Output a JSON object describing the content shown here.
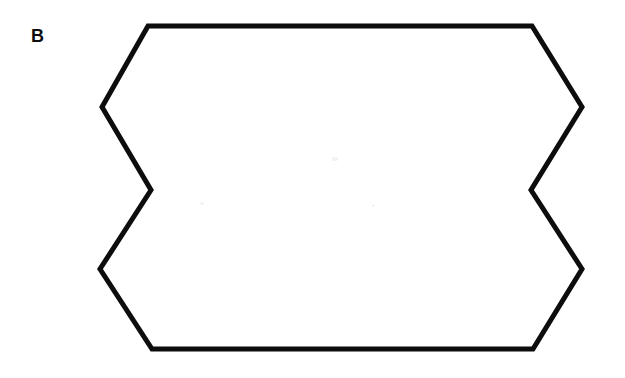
{
  "figure": {
    "panel_label": "B",
    "background_color": "#ffffff",
    "stroke_color": "#0d0d0d",
    "stroke_width": 5,
    "canvas_width": 625,
    "canvas_height": 378
  },
  "chart_data": {
    "type": "diagram",
    "title": "B",
    "shape_name": "concave-decagon-outline",
    "fill": "none",
    "stroke": "#0d0d0d",
    "stroke_width": 5,
    "closed": true,
    "xlim": [
      0,
      625
    ],
    "ylim": [
      0,
      378
    ],
    "grid": false,
    "legend": false,
    "vertices": [
      {
        "name": "top-left",
        "x": 148,
        "y": 26
      },
      {
        "name": "top-right",
        "x": 532,
        "y": 26
      },
      {
        "name": "right-upper-bulge",
        "x": 582,
        "y": 107
      },
      {
        "name": "right-inner-notch",
        "x": 531,
        "y": 190
      },
      {
        "name": "right-lower-bulge",
        "x": 582,
        "y": 269
      },
      {
        "name": "bottom-right",
        "x": 533,
        "y": 349
      },
      {
        "name": "bottom-left",
        "x": 152,
        "y": 349
      },
      {
        "name": "left-lower-bulge",
        "x": 100,
        "y": 269
      },
      {
        "name": "left-inner-notch",
        "x": 151,
        "y": 190
      },
      {
        "name": "left-upper-bulge",
        "x": 102,
        "y": 107
      }
    ],
    "annotations": [
      {
        "text": "B",
        "x": 31,
        "y": 27,
        "bold": true,
        "font_size": 18
      }
    ]
  }
}
